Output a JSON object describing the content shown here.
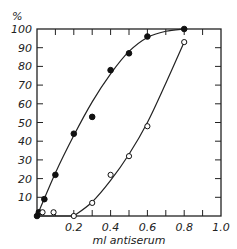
{
  "chart_data": {
    "type": "line",
    "title": "",
    "xlabel": "ml antiserum",
    "ylabel": "%",
    "xlim": [
      0,
      1.0
    ],
    "ylim": [
      0,
      100
    ],
    "x_ticks": [
      0.2,
      0.4,
      0.6,
      0.8,
      1.0
    ],
    "x_tick_labels": [
      "0.2",
      "0.4",
      "0.6",
      "0.8",
      "1.0"
    ],
    "y_ticks": [
      10,
      20,
      30,
      40,
      50,
      60,
      70,
      80,
      90,
      100
    ],
    "y_tick_labels": [
      "10",
      "20",
      "30",
      "40",
      "50",
      "60",
      "70",
      "80",
      "90",
      "100"
    ],
    "grid": false,
    "legend": null,
    "series": [
      {
        "name": "filled circles",
        "marker": "filled-circle",
        "color": "#111111",
        "points": [
          {
            "x": 0.0,
            "y": 0
          },
          {
            "x": 0.01,
            "y": 2
          },
          {
            "x": 0.04,
            "y": 9
          },
          {
            "x": 0.1,
            "y": 22
          },
          {
            "x": 0.2,
            "y": 44
          },
          {
            "x": 0.3,
            "y": 53
          },
          {
            "x": 0.4,
            "y": 78
          },
          {
            "x": 0.5,
            "y": 87
          },
          {
            "x": 0.6,
            "y": 96
          },
          {
            "x": 0.8,
            "y": 100
          }
        ]
      },
      {
        "name": "open circles",
        "marker": "open-circle",
        "color": "#111111",
        "points": [
          {
            "x": 0.03,
            "y": 2
          },
          {
            "x": 0.09,
            "y": 2
          },
          {
            "x": 0.2,
            "y": 0
          },
          {
            "x": 0.3,
            "y": 7
          },
          {
            "x": 0.4,
            "y": 22
          },
          {
            "x": 0.5,
            "y": 32
          },
          {
            "x": 0.6,
            "y": 48
          },
          {
            "x": 0.8,
            "y": 93
          }
        ]
      }
    ]
  }
}
